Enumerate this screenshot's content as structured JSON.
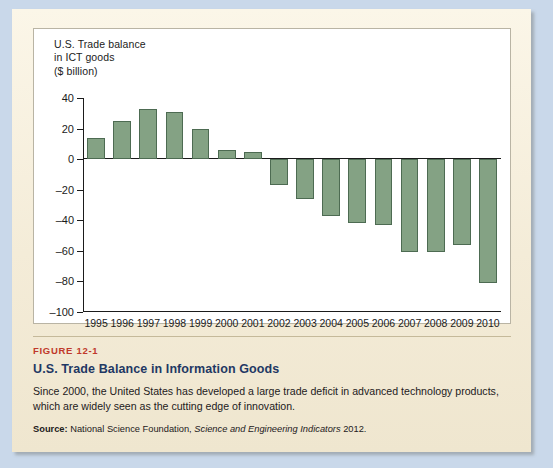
{
  "figure": {
    "number": "FIGURE 12-1",
    "title": "U.S. Trade Balance in Information Goods",
    "description": "Since 2000, the United States has developed a large trade deficit in advanced technology products, which are widely seen as the cutting edge of innovation.",
    "source_label": "Source:",
    "source_text_1": "National Science Foundation,",
    "source_italic": "Science and Engineering Indicators",
    "source_text_2": "2012."
  },
  "colors": {
    "bar_fill": "#84a284",
    "bar_stroke": "#4d6b52",
    "figure_number": "#c0392b",
    "figure_title": "#1f3864",
    "page_background": "#f6efdc",
    "outer_background": "#c9d8ea",
    "panel_background": "#ffffff"
  },
  "chart_data": {
    "type": "bar",
    "title": "U.S. Trade balance\nin ICT goods\n($ billion)",
    "xlabel": "",
    "ylabel": "$ billion",
    "ylim": [
      -100,
      40
    ],
    "ytick_values": [
      40,
      20,
      0,
      -20,
      -40,
      -60,
      -80,
      -100
    ],
    "ytick_labels": [
      "40",
      "20",
      "0",
      "–20",
      "–40",
      "–60",
      "–80",
      "–100"
    ],
    "grid": false,
    "legend": null,
    "categories": [
      "1995",
      "1996",
      "1997",
      "1998",
      "1999",
      "2000",
      "2001",
      "2002",
      "2003",
      "2004",
      "2005",
      "2006",
      "2007",
      "2008",
      "2009",
      "2010"
    ],
    "values": [
      14,
      25,
      33,
      31,
      20,
      6,
      5,
      -17,
      -26,
      -37,
      -42,
      -43,
      -61,
      -61,
      -56,
      -81
    ]
  }
}
